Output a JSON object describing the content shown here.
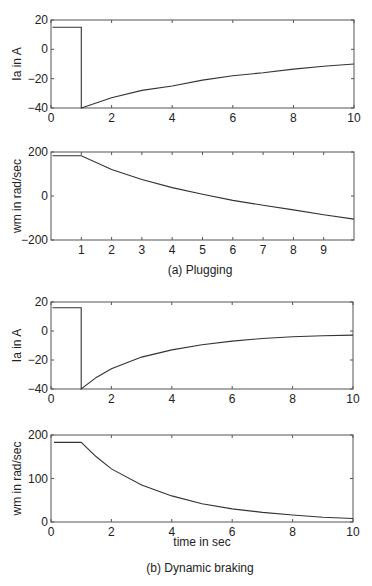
{
  "chart_data": [
    {
      "id": "plugging_ia",
      "type": "line",
      "title": "",
      "xlabel": "",
      "ylabel": "Ia in A",
      "xlim": [
        0,
        10
      ],
      "ylim": [
        -40,
        20
      ],
      "xticks": [
        0,
        2,
        4,
        6,
        8,
        10
      ],
      "yticks": [
        -40,
        -20,
        0,
        20
      ],
      "grid": false,
      "series": [
        {
          "name": "Ia",
          "x": [
            0.05,
            1.0,
            1.0,
            2,
            3,
            4,
            5,
            6,
            7,
            8,
            9,
            10
          ],
          "y": [
            15,
            15,
            -40,
            -33,
            -28,
            -25,
            -21,
            -18,
            -16,
            -13.5,
            -11.5,
            -10
          ]
        }
      ]
    },
    {
      "id": "plugging_wm",
      "type": "line",
      "title": "",
      "xlabel": "",
      "ylabel": "wm in rad/sec",
      "xlim": [
        0,
        10
      ],
      "ylim": [
        -200,
        200
      ],
      "xticks": [
        1,
        2,
        3,
        4,
        5,
        6,
        7,
        8,
        9
      ],
      "yticks": [
        -200,
        0,
        200
      ],
      "grid": false,
      "series": [
        {
          "name": "wm",
          "x": [
            0.05,
            1,
            2,
            3,
            4,
            5,
            6,
            7,
            8,
            9,
            10
          ],
          "y": [
            183,
            183,
            120,
            75,
            38,
            8,
            -20,
            -42,
            -63,
            -85,
            -105
          ]
        }
      ]
    },
    {
      "id": "dynamic_ia",
      "type": "line",
      "title": "",
      "xlabel": "",
      "ylabel": "Ia in A",
      "xlim": [
        0,
        10
      ],
      "ylim": [
        -40,
        20
      ],
      "xticks": [
        0,
        2,
        4,
        6,
        8,
        10
      ],
      "yticks": [
        -40,
        -20,
        0,
        20
      ],
      "grid": false,
      "series": [
        {
          "name": "Ia",
          "x": [
            0.05,
            1.0,
            1.0,
            1.5,
            2,
            3,
            4,
            5,
            6,
            7,
            8,
            9,
            10
          ],
          "y": [
            16,
            16,
            -40,
            -32,
            -26,
            -18,
            -13,
            -9.5,
            -7,
            -5.2,
            -4,
            -3.3,
            -2.8
          ]
        }
      ]
    },
    {
      "id": "dynamic_wm",
      "type": "line",
      "title": "",
      "xlabel": "time in sec",
      "ylabel": "wm in rad/sec",
      "xlim": [
        0,
        10
      ],
      "ylim": [
        0,
        200
      ],
      "xticks": [
        0,
        2,
        4,
        6,
        8,
        10
      ],
      "yticks": [
        0,
        100,
        200
      ],
      "grid": false,
      "series": [
        {
          "name": "wm",
          "x": [
            0.1,
            1,
            1.5,
            2,
            3,
            4,
            5,
            6,
            7,
            8,
            9,
            10
          ],
          "y": [
            183,
            183,
            150,
            122,
            85,
            60,
            42,
            30,
            22,
            16,
            11,
            8
          ]
        }
      ]
    }
  ],
  "captions": {
    "a": "(a) Plugging",
    "b": "(b) Dynamic braking"
  },
  "axis_text": {
    "ia_label": "Ia in A",
    "wm_label": "wm in rad/sec",
    "time_label": "time in sec"
  }
}
